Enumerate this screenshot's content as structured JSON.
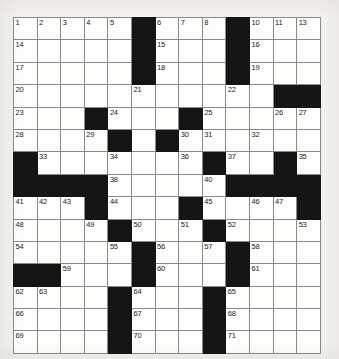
{
  "puzzle": {
    "name": "crossword-grid",
    "rows": 15,
    "cols": 13,
    "background_color": "#f2f1ee",
    "cell_fill_color": "#fdfdfb",
    "block_color": "#151515",
    "grid_line_color": "#8a8a8a",
    "border_color": "#3a3a3a",
    "blocks": [
      [
        0,
        5
      ],
      [
        0,
        9
      ],
      [
        1,
        5
      ],
      [
        1,
        9
      ],
      [
        2,
        5
      ],
      [
        2,
        9
      ],
      [
        3,
        11
      ],
      [
        3,
        12
      ],
      [
        4,
        3
      ],
      [
        4,
        7
      ],
      [
        5,
        4
      ],
      [
        5,
        6
      ],
      [
        6,
        0
      ],
      [
        6,
        8
      ],
      [
        6,
        11
      ],
      [
        7,
        0
      ],
      [
        7,
        1
      ],
      [
        7,
        2
      ],
      [
        7,
        3
      ],
      [
        7,
        9
      ],
      [
        7,
        10
      ],
      [
        7,
        11
      ],
      [
        7,
        12
      ],
      [
        8,
        3
      ],
      [
        8,
        7
      ],
      [
        8,
        12
      ],
      [
        9,
        4
      ],
      [
        9,
        8
      ],
      [
        10,
        5
      ],
      [
        10,
        9
      ],
      [
        11,
        0
      ],
      [
        11,
        1
      ],
      [
        11,
        5
      ],
      [
        11,
        9
      ],
      [
        12,
        4
      ],
      [
        12,
        8
      ],
      [
        13,
        4
      ],
      [
        13,
        8
      ],
      [
        14,
        4
      ],
      [
        14,
        8
      ]
    ],
    "numbers": [
      {
        "row": 0,
        "col": 0,
        "n": "1"
      },
      {
        "row": 0,
        "col": 1,
        "n": "2"
      },
      {
        "row": 0,
        "col": 2,
        "n": "3"
      },
      {
        "row": 0,
        "col": 3,
        "n": "4"
      },
      {
        "row": 0,
        "col": 4,
        "n": "5"
      },
      {
        "row": 0,
        "col": 6,
        "n": "6"
      },
      {
        "row": 0,
        "col": 7,
        "n": "7"
      },
      {
        "row": 0,
        "col": 8,
        "n": "8"
      },
      {
        "row": 0,
        "col": 9,
        "n": "9"
      },
      {
        "row": 0,
        "col": 10,
        "n": "10"
      },
      {
        "row": 0,
        "col": 11,
        "n": "11"
      },
      {
        "row": 0,
        "col": 12,
        "n": "12"
      },
      {
        "row": 1,
        "col": 0,
        "n": "14"
      },
      {
        "row": 1,
        "col": 6,
        "n": "15"
      },
      {
        "row": 1,
        "col": 10,
        "n": "16"
      },
      {
        "row": 2,
        "col": 0,
        "n": "17"
      },
      {
        "row": 2,
        "col": 6,
        "n": "18"
      },
      {
        "row": 2,
        "col": 10,
        "n": "19"
      },
      {
        "row": 3,
        "col": 0,
        "n": "20"
      },
      {
        "row": 3,
        "col": 5,
        "n": "21"
      },
      {
        "row": 3,
        "col": 9,
        "n": "22"
      },
      {
        "row": 4,
        "col": 0,
        "n": "23"
      },
      {
        "row": 4,
        "col": 4,
        "n": "24"
      },
      {
        "row": 4,
        "col": 8,
        "n": "25"
      },
      {
        "row": 4,
        "col": 11,
        "n": "26"
      },
      {
        "row": 4,
        "col": 12,
        "n": "27"
      },
      {
        "row": 5,
        "col": 0,
        "n": "28"
      },
      {
        "row": 5,
        "col": 3,
        "n": "29"
      },
      {
        "row": 5,
        "col": 7,
        "n": "30"
      },
      {
        "row": 6,
        "col": 1,
        "n": "33"
      },
      {
        "row": 6,
        "col": 4,
        "n": "34"
      },
      {
        "row": 6,
        "col": 9,
        "n": "37"
      },
      {
        "row": 7,
        "col": 4,
        "n": "38"
      },
      {
        "row": 7,
        "col": 8,
        "n": "40"
      },
      {
        "row": 8,
        "col": 0,
        "n": "41"
      },
      {
        "row": 8,
        "col": 1,
        "n": "42"
      },
      {
        "row": 8,
        "col": 2,
        "n": "43"
      },
      {
        "row": 8,
        "col": 4,
        "n": "44"
      },
      {
        "row": 8,
        "col": 8,
        "n": "45"
      },
      {
        "row": 8,
        "col": 10,
        "n": "46"
      },
      {
        "row": 8,
        "col": 11,
        "n": "47"
      },
      {
        "row": 9,
        "col": 0,
        "n": "48"
      },
      {
        "row": 9,
        "col": 3,
        "n": "49"
      },
      {
        "row": 9,
        "col": 5,
        "n": "50"
      },
      {
        "row": 9,
        "col": 7,
        "n": "51"
      },
      {
        "row": 9,
        "col": 9,
        "n": "52"
      },
      {
        "row": 9,
        "col": 12,
        "n": "53"
      },
      {
        "row": 10,
        "col": 0,
        "n": "54"
      },
      {
        "row": 10,
        "col": 4,
        "n": "55"
      },
      {
        "row": 10,
        "col": 6,
        "n": "56"
      },
      {
        "row": 10,
        "col": 8,
        "n": "57"
      },
      {
        "row": 10,
        "col": 10,
        "n": "58"
      },
      {
        "row": 11,
        "col": 2,
        "n": "59"
      },
      {
        "row": 11,
        "col": 6,
        "n": "60"
      },
      {
        "row": 11,
        "col": 10,
        "n": "61"
      },
      {
        "row": 12,
        "col": 0,
        "n": "62"
      },
      {
        "row": 12,
        "col": 1,
        "n": "63"
      },
      {
        "row": 12,
        "col": 5,
        "n": "64"
      },
      {
        "row": 12,
        "col": 9,
        "n": "65"
      },
      {
        "row": 13,
        "col": 0,
        "n": "66"
      },
      {
        "row": 13,
        "col": 5,
        "n": "67"
      },
      {
        "row": 13,
        "col": 9,
        "n": "68"
      },
      {
        "row": 14,
        "col": 0,
        "n": "69"
      },
      {
        "row": 14,
        "col": 5,
        "n": "70"
      },
      {
        "row": 14,
        "col": 9,
        "n": "71"
      }
    ],
    "extra_numbers": [
      {
        "row": 0,
        "col": 12,
        "n": "13"
      },
      {
        "row": 5,
        "col": 8,
        "n": "31"
      },
      {
        "row": 5,
        "col": 10,
        "n": "32"
      },
      {
        "row": 6,
        "col": 7,
        "n": "36"
      },
      {
        "row": 6,
        "col": 12,
        "n": "35"
      },
      {
        "row": 7,
        "col": 10,
        "n": "39"
      }
    ]
  }
}
